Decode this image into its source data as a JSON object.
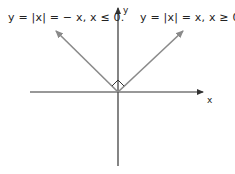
{
  "diagram": {
    "labels": {
      "left_branch": "y = |x| = − x, x ≤ 0.",
      "right_branch": "y = |x| = x, x ≥ 0.",
      "x_axis": "x",
      "y_axis": "y"
    },
    "colors": {
      "axis": "#333333",
      "branch": "#8a8a8a",
      "text": "#222222"
    },
    "geometry": {
      "origin": [
        118,
        92
      ],
      "x_axis_range_px": [
        30,
        203
      ],
      "y_axis_range_px": [
        8,
        166
      ],
      "left_branch_tip": [
        55,
        30
      ],
      "right_branch_tip": [
        184,
        30
      ]
    },
    "annotations": [
      "right-angle marker at origin between the two branches"
    ]
  }
}
